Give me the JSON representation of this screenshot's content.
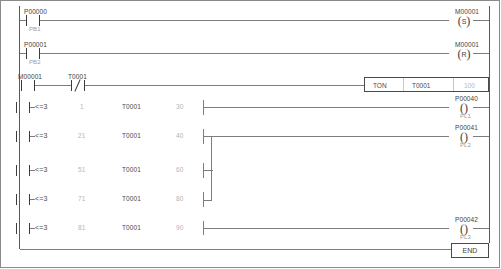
{
  "diagram": {
    "colors": {
      "rail": "#5a5a5a",
      "wire": "#7d7d7d",
      "symbol": "#3c3c3c",
      "label": "#4a4a4a",
      "dim_value": "#b4b4b4",
      "border": "#8a8a8a",
      "background": "#ffffff"
    }
  },
  "rungs": [
    {
      "id": "rung-1",
      "contacts": [
        {
          "device": "P00000",
          "comment": "PB1",
          "type": "normally-open"
        }
      ],
      "outputs": [
        {
          "device": "M00001",
          "coil": "S",
          "comment": ""
        }
      ]
    },
    {
      "id": "rung-2",
      "contacts": [
        {
          "device": "P00001",
          "comment": "PB2",
          "type": "normally-open"
        }
      ],
      "outputs": [
        {
          "device": "M00001",
          "coil": "R",
          "comment": ""
        }
      ]
    },
    {
      "id": "rung-3",
      "contacts": [
        {
          "device": "M00001",
          "comment": "",
          "type": "normally-open"
        },
        {
          "device": "T0001",
          "comment": "",
          "type": "normally-closed"
        }
      ],
      "block": {
        "instruction": "TON",
        "operand1": "T0001",
        "operand2": "100"
      }
    },
    {
      "id": "rung-4",
      "compare": {
        "operator": "<=3",
        "value": "1",
        "device": "T0001",
        "setpoint": "30"
      },
      "outputs": [
        {
          "device": "P00040",
          "coil": "",
          "comment": "PL1"
        }
      ]
    },
    {
      "id": "rung-5",
      "compare": {
        "operator": "<=3",
        "value": "21",
        "device": "T0001",
        "setpoint": "40"
      },
      "outputs": [
        {
          "device": "P00041",
          "coil": "",
          "comment": "PL2"
        }
      ]
    },
    {
      "id": "rung-6",
      "compare": {
        "operator": "<=3",
        "value": "51",
        "device": "T0001",
        "setpoint": "60"
      },
      "outputs": []
    },
    {
      "id": "rung-7",
      "compare": {
        "operator": "<=3",
        "value": "71",
        "device": "T0001",
        "setpoint": "80"
      },
      "outputs": []
    },
    {
      "id": "rung-8",
      "compare": {
        "operator": "<=3",
        "value": "81",
        "device": "T0001",
        "setpoint": "90"
      },
      "outputs": [
        {
          "device": "P00042",
          "coil": "",
          "comment": "PL3"
        }
      ]
    }
  ],
  "end_block": {
    "label": "END"
  },
  "glyphs": {
    "coil_open_left": "(",
    "coil_open_right": ")",
    "set_letter": "S",
    "reset_letter": "R"
  }
}
